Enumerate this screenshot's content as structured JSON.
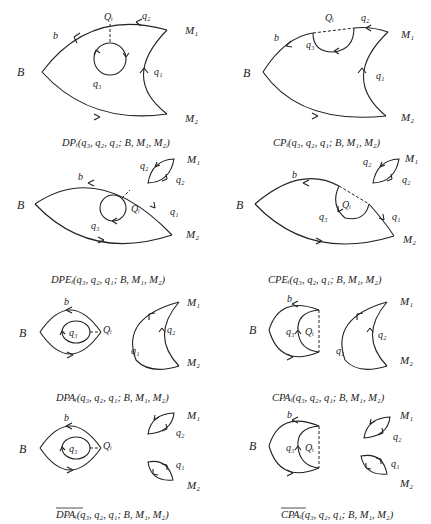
{
  "panels": [
    {
      "id": "DP",
      "caption": "DPᵢ(q₃, q₂, q₁; B, M₁, M₂)",
      "labels": {
        "B": "B",
        "b": "b",
        "Q": "Qᵢ",
        "q1": "q₁",
        "q2": "q₂",
        "q3": "q₃",
        "M1": "M₁",
        "M2": "M₂"
      }
    },
    {
      "id": "CP",
      "caption": "CPᵢ(q₃, q₂, q₁; B, M₁, M₂)",
      "labels": {
        "B": "B",
        "b": "b",
        "Q": "Qᵢ",
        "q1": "q₁",
        "q2": "q₂",
        "q3": "q₃",
        "M1": "M₁",
        "M2": "M₂"
      }
    },
    {
      "id": "DPE",
      "caption": "DPEᵢ(q₃, q₂, q₁; B, M₁, M₂)",
      "labels": {
        "B": "B",
        "b": "b",
        "Q": "Qᵢ",
        "q1": "q₁",
        "q2a": "q₂",
        "q2b": "q₂",
        "q3": "q₃",
        "M1": "M₁",
        "M2": "M₂"
      }
    },
    {
      "id": "CPE",
      "caption": "CPEᵢ(q₃, q₂, q₁; B, M₁, M₂)",
      "labels": {
        "B": "B",
        "b": "b",
        "Q": "Qᵢ",
        "q1": "q₁",
        "q2a": "q₂",
        "q2b": "q₂",
        "q3": "q₃",
        "M1": "M₁",
        "M2": "M₂"
      }
    },
    {
      "id": "DPA",
      "caption": "DPAᵢ(q₃, q₂, q₁; B, M₁, M₂)",
      "labels": {
        "B": "B",
        "b": "b",
        "Q": "Qᵢ",
        "q1": "q₁",
        "q2": "q₂",
        "q3": "q₃",
        "M1": "M₁",
        "M2": "M₂"
      }
    },
    {
      "id": "CPA",
      "caption": "CPAᵢ(q₃, q₂, q₁; B, M₁, M₂)",
      "labels": {
        "B": "B",
        "b": "b",
        "Q": "Qᵢ",
        "q1": "q₁",
        "q2": "q₂",
        "q3": "q₃",
        "M1": "M₁",
        "M2": "M₂"
      }
    },
    {
      "id": "DPAbar",
      "caption_name": "DPA",
      "caption_rest": "ᵢ(q₃, q₂, q₁; B, M₁, M₂)",
      "labels": {
        "B": "B",
        "b": "b",
        "Q": "Qᵢ",
        "q1": "q₁",
        "q2": "q₂",
        "q3": "q₃",
        "M1": "M₁",
        "M2": "M₂"
      }
    },
    {
      "id": "CPAbar",
      "caption_name": "CPA",
      "caption_rest": "ᵢ(q₃, q₂, q₁; B, M₁, M₂)",
      "labels": {
        "B": "B",
        "b": "b",
        "Q": "Qᵢ",
        "q1": "q₁",
        "q2": "q₂",
        "q3": "q₃",
        "M1": "M₁",
        "M2": "M₂"
      }
    }
  ]
}
